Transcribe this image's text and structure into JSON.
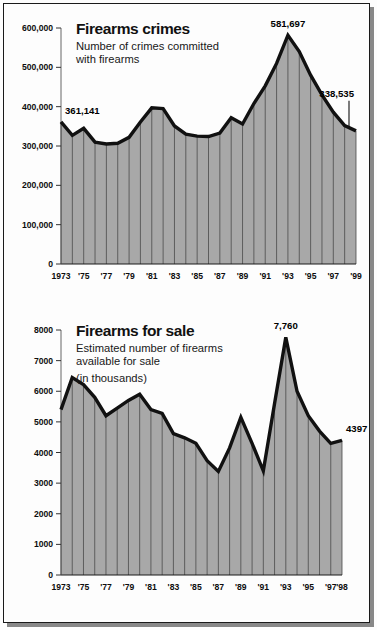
{
  "chart_data": [
    {
      "id": "firearms-crimes",
      "type": "area",
      "title": "Firearms crimes",
      "subtitle": "Number of crimes committed\nwith firearms",
      "subtitle_line1": "Number of crimes committed",
      "subtitle_line2": "with firearms",
      "xlabel": "",
      "ylabel": "",
      "ylim": [
        0,
        600000
      ],
      "yticks": [
        0,
        100000,
        200000,
        300000,
        400000,
        500000,
        600000
      ],
      "ytick_labels": [
        "0",
        "100,000",
        "200,000",
        "300,000",
        "400,000",
        "500,000",
        "600,000"
      ],
      "grid": true,
      "x": [
        1973,
        1974,
        1975,
        1976,
        1977,
        1978,
        1979,
        1980,
        1981,
        1982,
        1983,
        1984,
        1985,
        1986,
        1987,
        1988,
        1989,
        1990,
        1991,
        1992,
        1993,
        1994,
        1995,
        1996,
        1997,
        1998,
        1999
      ],
      "xtick_labels": [
        "1973",
        "",
        "'75",
        "",
        "'77",
        "",
        "'79",
        "",
        "'81",
        "",
        "'83",
        "",
        "'85",
        "",
        "'87",
        "",
        "'89",
        "",
        "'91",
        "",
        "'93",
        "",
        "'95",
        "",
        "'97",
        "",
        "'99"
      ],
      "values": [
        361141,
        327000,
        345000,
        310000,
        305000,
        307000,
        322000,
        361000,
        397000,
        395000,
        351000,
        330000,
        325000,
        324000,
        333000,
        372000,
        356000,
        408000,
        453000,
        510000,
        581697,
        540000,
        480000,
        430000,
        386000,
        352000,
        338535
      ],
      "annotations": [
        {
          "label": "361,141",
          "x": 1973,
          "y": 361141,
          "position": "above-right"
        },
        {
          "label": "581,697",
          "x": 1993,
          "y": 581697,
          "position": "above"
        },
        {
          "label": "338,535",
          "x": 1999,
          "y": 338535,
          "position": "above-with-leader"
        }
      ],
      "fill_color": "#a8a8a8",
      "line_color": "#111111"
    },
    {
      "id": "firearms-for-sale",
      "type": "area",
      "title": "Firearms for sale",
      "subtitle_line1": "Estimated number of firearms",
      "subtitle_line2": "available for sale",
      "subtitle_line3": "(in thousands)",
      "xlabel": "",
      "ylabel": "",
      "ylim": [
        0,
        8000
      ],
      "yticks": [
        0,
        1000,
        2000,
        3000,
        4000,
        5000,
        6000,
        7000,
        8000
      ],
      "ytick_labels": [
        "0",
        "1000",
        "2000",
        "3000",
        "4000",
        "5000",
        "6000",
        "7000",
        "8000"
      ],
      "grid": true,
      "x": [
        1973,
        1974,
        1975,
        1976,
        1977,
        1978,
        1979,
        1980,
        1981,
        1982,
        1983,
        1984,
        1985,
        1986,
        1987,
        1988,
        1989,
        1990,
        1991,
        1992,
        1993,
        1994,
        1995,
        1996,
        1997,
        1998
      ],
      "xtick_labels": [
        "1973",
        "",
        "'75",
        "",
        "'77",
        "",
        "'79",
        "",
        "'81",
        "",
        "'83",
        "",
        "'85",
        "",
        "'87",
        "",
        "'89",
        "",
        "'91",
        "",
        "'93",
        "",
        "'95",
        "",
        "'97",
        "'98"
      ],
      "values": [
        5400,
        6450,
        6220,
        5800,
        5200,
        5450,
        5700,
        5900,
        5400,
        5280,
        4620,
        4480,
        4300,
        3730,
        3380,
        4150,
        5150,
        4300,
        3400,
        5600,
        7760,
        6000,
        5200,
        4700,
        4300,
        4397
      ],
      "annotations": [
        {
          "label": "7,760",
          "x": 1993,
          "y": 7760,
          "position": "above"
        },
        {
          "label": "4397",
          "x": 1998,
          "y": 4397,
          "position": "above-right"
        }
      ],
      "fill_color": "#a8a8a8",
      "line_color": "#111111"
    }
  ]
}
